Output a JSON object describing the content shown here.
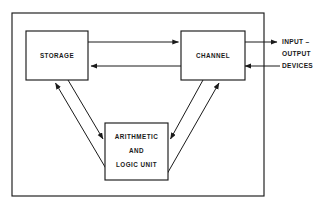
{
  "diagram": {
    "stroke_color": "#1a1a1a",
    "background_color": "#ffffff",
    "boundary": {
      "name": "system-boundary",
      "x": 12,
      "y": 13,
      "width": 252,
      "height": 183
    },
    "blocks": [
      {
        "id": "storage",
        "label": "STORAGE",
        "lines": [
          "STORAGE"
        ],
        "x": 26,
        "y": 31,
        "width": 62,
        "height": 49
      },
      {
        "id": "channel",
        "label": "CHANNEL",
        "lines": [
          "CHANNEL"
        ],
        "x": 181,
        "y": 31,
        "width": 64,
        "height": 49
      },
      {
        "id": "alu",
        "label": "ARITHMETIC AND LOGIC UNIT",
        "lines": [
          "ARITHMETIC",
          "AND",
          "LOGIC UNIT"
        ],
        "x": 105,
        "y": 123,
        "width": 63,
        "height": 57
      }
    ],
    "external_label": {
      "id": "input-output-devices",
      "lines": [
        "INPUT –",
        "OUTPUT",
        "DEVICES"
      ],
      "x": 282,
      "y": 42
    },
    "connections": [
      {
        "id": "storage-to-channel",
        "from": "storage",
        "to": "channel",
        "direction": "right",
        "kind": "horizontal"
      },
      {
        "id": "channel-to-storage",
        "from": "channel",
        "to": "storage",
        "direction": "left",
        "kind": "horizontal"
      },
      {
        "id": "storage-to-alu",
        "from": "storage",
        "to": "alu",
        "direction": "down-right",
        "kind": "diagonal"
      },
      {
        "id": "alu-to-storage",
        "from": "alu",
        "to": "storage",
        "direction": "up-left",
        "kind": "diagonal"
      },
      {
        "id": "channel-to-alu",
        "from": "channel",
        "to": "alu",
        "direction": "down-left",
        "kind": "diagonal"
      },
      {
        "id": "alu-to-channel",
        "from": "alu",
        "to": "channel",
        "direction": "up-right",
        "kind": "diagonal"
      },
      {
        "id": "channel-to-io-devices",
        "from": "channel",
        "to": "input-output-devices",
        "direction": "right",
        "kind": "horizontal"
      },
      {
        "id": "io-devices-to-channel",
        "from": "input-output-devices",
        "to": "channel",
        "direction": "left",
        "kind": "horizontal"
      }
    ]
  }
}
